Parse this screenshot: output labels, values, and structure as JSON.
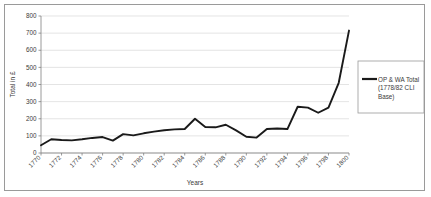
{
  "chart_data": {
    "type": "line",
    "title": "",
    "xlabel": "Years",
    "ylabel": "Total in £",
    "ylim": [
      0,
      800
    ],
    "ytick_step": 100,
    "yticks": [
      0,
      100,
      200,
      300,
      400,
      500,
      600,
      700,
      800
    ],
    "xlim": [
      1770,
      1800
    ],
    "xtick_step": 2,
    "xticks": [
      1770,
      1772,
      1774,
      1776,
      1778,
      1780,
      1782,
      1784,
      1786,
      1788,
      1790,
      1792,
      1794,
      1796,
      1798,
      1800
    ],
    "xtick_rotation": -45,
    "grid": "horizontal",
    "legend_position": "right",
    "line_color": "#1a1a1a",
    "series": [
      {
        "name": "OP & WA Total (1778/82 CLI Base)",
        "legend_line1": "OP & WA Total",
        "legend_line2": "(1778/82 CLI",
        "legend_line3": "Base)",
        "x": [
          1770,
          1771,
          1772,
          1773,
          1774,
          1775,
          1776,
          1777,
          1778,
          1779,
          1780,
          1781,
          1782,
          1783,
          1784,
          1785,
          1786,
          1787,
          1788,
          1789,
          1790,
          1791,
          1792,
          1793,
          1794,
          1795,
          1796,
          1797,
          1798,
          1799,
          1800
        ],
        "values": [
          45,
          80,
          76,
          74,
          80,
          88,
          93,
          72,
          110,
          103,
          115,
          125,
          133,
          138,
          140,
          200,
          152,
          150,
          165,
          132,
          95,
          90,
          140,
          143,
          140,
          135,
          100,
          78,
          95,
          125,
          122
        ]
      }
    ]
  },
  "chart_series_tail": {
    "note_x": [
      1795,
      1796,
      1797,
      1798,
      1799,
      1800
    ],
    "note_values": [
      270,
      265,
      235,
      265,
      410,
      715
    ]
  },
  "axis": {
    "y_title": "Total in £",
    "x_title": "Years"
  }
}
